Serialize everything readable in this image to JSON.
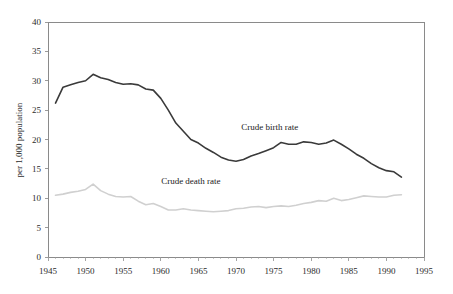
{
  "chart_data": {
    "type": "line",
    "title": "",
    "xlabel": "",
    "ylabel": "per 1,000 population",
    "xlim": [
      1945,
      1995
    ],
    "ylim": [
      0,
      40
    ],
    "grid": false,
    "legend_position": "inline-annotations",
    "x_tick_labels": [
      "1945",
      "1950",
      "1955",
      "1960",
      "1965",
      "1970",
      "1975",
      "1980",
      "1985",
      "1990",
      "1995"
    ],
    "x_ticks": [
      1945,
      1950,
      1955,
      1960,
      1965,
      1970,
      1975,
      1980,
      1985,
      1990,
      1995
    ],
    "x_minor_tick_step": 1,
    "y_tick_labels": [
      "0",
      "5",
      "10",
      "15",
      "20",
      "25",
      "30",
      "35",
      "40"
    ],
    "y_ticks": [
      0,
      5,
      10,
      15,
      20,
      25,
      30,
      35,
      40
    ],
    "x": [
      1946,
      1947,
      1948,
      1949,
      1950,
      1951,
      1952,
      1953,
      1954,
      1955,
      1956,
      1957,
      1958,
      1959,
      1960,
      1961,
      1962,
      1963,
      1964,
      1965,
      1966,
      1967,
      1968,
      1969,
      1970,
      1971,
      1972,
      1973,
      1974,
      1975,
      1976,
      1977,
      1978,
      1979,
      1980,
      1981,
      1982,
      1983,
      1984,
      1985,
      1986,
      1987,
      1988,
      1989,
      1990,
      1991,
      1992
    ],
    "series": [
      {
        "name": "Crude birth rate",
        "color": "#3a3a3a",
        "line_width": 1.6,
        "annotation": {
          "text": "Crude birth rate",
          "x": 1974.5,
          "y": 21.6
        },
        "values": [
          26.2,
          28.9,
          29.3,
          29.7,
          30.0,
          31.1,
          30.5,
          30.2,
          29.7,
          29.4,
          29.5,
          29.3,
          28.6,
          28.4,
          27.0,
          25.0,
          22.8,
          21.4,
          20.0,
          19.4,
          18.5,
          17.8,
          17.0,
          16.5,
          16.3,
          16.6,
          17.2,
          17.6,
          18.1,
          18.6,
          19.5,
          19.2,
          19.2,
          19.6,
          19.5,
          19.2,
          19.4,
          19.9,
          19.2,
          18.4,
          17.5,
          16.8,
          15.9,
          15.2,
          14.7,
          14.5,
          13.6
        ]
      },
      {
        "name": "Crude death rate",
        "color": "#d0d0d0",
        "line_width": 1.6,
        "annotation": {
          "text": "Crude death rate",
          "x": 1964.0,
          "y": 12.4
        },
        "values": [
          10.5,
          10.7,
          11.0,
          11.2,
          11.5,
          12.4,
          11.3,
          10.7,
          10.3,
          10.2,
          10.3,
          9.5,
          8.9,
          9.1,
          8.6,
          8.0,
          8.0,
          8.2,
          8.0,
          7.9,
          7.8,
          7.7,
          7.8,
          7.9,
          8.2,
          8.3,
          8.5,
          8.6,
          8.4,
          8.6,
          8.7,
          8.6,
          8.8,
          9.1,
          9.3,
          9.6,
          9.5,
          10.0,
          9.6,
          9.8,
          10.1,
          10.4,
          10.3,
          10.2,
          10.2,
          10.5,
          10.6
        ]
      }
    ]
  }
}
